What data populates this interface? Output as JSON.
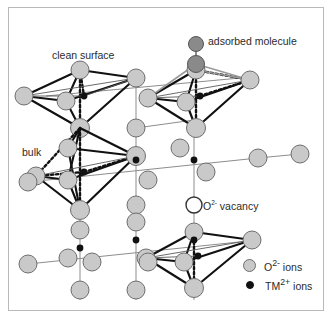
{
  "figure": {
    "background": "#ffffff",
    "frame_color": "#b9b9b9"
  },
  "labels": {
    "clean_surface": "clean surface",
    "bulk": "bulk",
    "adsorbed_molecule": "adsorbed molecule",
    "vacancy_symbol": "O",
    "vacancy_charge": "2-",
    "vacancy_text": " vacancy"
  },
  "legend": {
    "items": [
      {
        "symbol": "O",
        "charge": "2-",
        "text": " ions",
        "marker": "oxygen-circle",
        "color": "#c9c9c9"
      },
      {
        "symbol": "TM",
        "charge": "2+",
        "text": " ions",
        "marker": "metal-dot",
        "color": "#111111"
      }
    ]
  },
  "colors": {
    "oxygen_ion": "#c9c9c9",
    "oxygen_ion_stroke": "#6e6e6e",
    "metal_ion": "#111111",
    "adsorbed_atom": "#8a8a8a",
    "adsorbed_atom_stroke": "#555555",
    "vacancy_fill": "#ffffff",
    "vacancy_stroke": "#333333",
    "bond_solid": "#111111",
    "bond_thin": "#4a4a4a",
    "bond_light": "#9a9a9a",
    "text": "#2b2b2b"
  },
  "structure": {
    "description": "Rock-salt type oxide lattice drawn as corner sharing octahedra. Grey spheres are O2- ions, small black dots are TM2+ ions at octahedral centres.",
    "octahedra": [
      {
        "name": "clean-surface-octahedron",
        "center": [
          80,
          96
        ],
        "region": "surface"
      },
      {
        "name": "adsorbate-octahedron",
        "center": [
          205,
          96
        ],
        "region": "surface"
      },
      {
        "name": "bulk-octahedron",
        "center": [
          80,
          172
        ],
        "region": "bulk"
      },
      {
        "name": "lower-octahedron",
        "center": [
          205,
          255
        ],
        "region": "bulk"
      }
    ],
    "adsorbate": {
      "atoms": 2,
      "top": [
        196,
        44
      ],
      "bottom": [
        196,
        64
      ]
    },
    "vacancy": {
      "position": [
        194,
        205
      ]
    }
  }
}
